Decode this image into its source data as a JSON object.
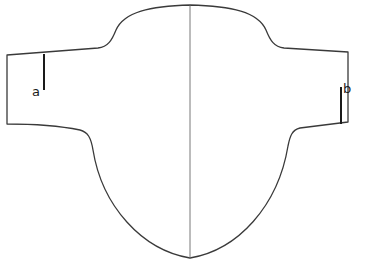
{
  "diagram": {
    "type": "pattern-piece",
    "labels": {
      "a": "a",
      "b": "b"
    },
    "colors": {
      "outline": "#3a3a3a",
      "marker": "#1a1a1a",
      "background": "#ffffff"
    }
  }
}
